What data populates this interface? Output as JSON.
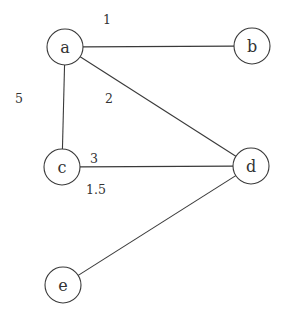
{
  "graph": {
    "nodes": [
      {
        "id": "a",
        "label": "a",
        "x": 65,
        "y": 47
      },
      {
        "id": "b",
        "label": "b",
        "x": 252,
        "y": 46
      },
      {
        "id": "c",
        "label": "c",
        "x": 62,
        "y": 167
      },
      {
        "id": "d",
        "label": "d",
        "x": 251,
        "y": 166
      },
      {
        "id": "e",
        "label": "e",
        "x": 63,
        "y": 285
      }
    ],
    "edges": [
      {
        "from": "a",
        "to": "b"
      },
      {
        "from": "a",
        "to": "c"
      },
      {
        "from": "a",
        "to": "d"
      },
      {
        "from": "c",
        "to": "d"
      },
      {
        "from": "d",
        "to": "e"
      }
    ],
    "edge_labels": [
      {
        "text": "1",
        "x": 107,
        "y": 19
      },
      {
        "text": "5",
        "x": 19,
        "y": 98
      },
      {
        "text": "2",
        "x": 109,
        "y": 98
      },
      {
        "text": "3",
        "x": 94,
        "y": 158
      },
      {
        "text": "1.5",
        "x": 96,
        "y": 189
      }
    ],
    "node_radius": 18,
    "colors": {
      "stroke": "#3a3a3a",
      "text": "#333333",
      "background": "#ffffff"
    }
  }
}
